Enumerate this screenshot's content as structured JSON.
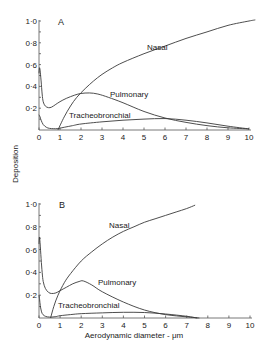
{
  "chart_data": [
    {
      "type": "line",
      "panel": "A",
      "title": "A",
      "xlabel": "Aerodynamic diameter - μm",
      "ylabel": "Deposition",
      "xlim": [
        0,
        10
      ],
      "ylim": [
        0,
        1.0
      ],
      "xticks": [
        "0",
        "1",
        "2",
        "3",
        "4",
        "5",
        "6",
        "7",
        "8",
        "9",
        "10"
      ],
      "yticks": [
        "0·2",
        "0·4",
        "0·6",
        "0·8",
        "1·0"
      ],
      "grid": false,
      "series": [
        {
          "name": "Nasal",
          "x": [
            0.9,
            1.2,
            1.5,
            1.8,
            2.2,
            2.6,
            3.0,
            3.5,
            4.0,
            5.0,
            6.0,
            7.0,
            8.0,
            9.0,
            10.0,
            10.3
          ],
          "y": [
            0.0,
            0.12,
            0.22,
            0.3,
            0.38,
            0.45,
            0.51,
            0.57,
            0.62,
            0.7,
            0.77,
            0.84,
            0.9,
            0.96,
            1.0,
            1.01
          ]
        },
        {
          "name": "Pulmonary",
          "x": [
            0.0,
            0.02,
            0.05,
            0.1,
            0.15,
            0.2,
            0.3,
            0.45,
            0.6,
            0.8,
            1.0,
            1.3,
            1.7,
            2.0,
            2.4,
            2.8,
            3.3,
            4.0,
            5.0,
            6.0,
            7.0,
            8.0,
            9.0,
            10.0
          ],
          "y": [
            0.52,
            0.57,
            0.55,
            0.45,
            0.33,
            0.26,
            0.22,
            0.205,
            0.21,
            0.235,
            0.26,
            0.29,
            0.32,
            0.335,
            0.34,
            0.33,
            0.3,
            0.25,
            0.17,
            0.11,
            0.07,
            0.04,
            0.02,
            0.01
          ]
        },
        {
          "name": "Tracheobronchial",
          "x": [
            0.0,
            0.05,
            0.1,
            0.2,
            0.35,
            0.5,
            0.7,
            0.9,
            1.2,
            1.6,
            2.0,
            3.0,
            4.0,
            5.0,
            6.0,
            7.0,
            8.0,
            9.0,
            10.0
          ],
          "y": [
            0.14,
            0.12,
            0.09,
            0.05,
            0.025,
            0.015,
            0.012,
            0.013,
            0.025,
            0.04,
            0.055,
            0.075,
            0.09,
            0.1,
            0.105,
            0.09,
            0.065,
            0.035,
            0.01
          ]
        }
      ]
    },
    {
      "type": "line",
      "panel": "B",
      "title": "B",
      "xlabel": "Aerodynamic diameter - μm",
      "ylabel": "Deposition",
      "xlim": [
        0,
        10
      ],
      "ylim": [
        0,
        1.0
      ],
      "xticks": [
        "0",
        "1",
        "2",
        "3",
        "4",
        "5",
        "6",
        "7",
        "8",
        "9",
        "10"
      ],
      "yticks": [
        "0·2",
        "0·4",
        "0·6",
        "0·8",
        "1·0"
      ],
      "grid": false,
      "series": [
        {
          "name": "Nasal",
          "x": [
            0.55,
            0.7,
            0.9,
            1.2,
            1.5,
            2.0,
            2.5,
            3.0,
            3.5,
            4.0,
            4.5,
            5.0,
            5.5,
            6.0,
            6.5,
            7.0,
            7.4
          ],
          "y": [
            0.0,
            0.1,
            0.2,
            0.31,
            0.39,
            0.5,
            0.58,
            0.65,
            0.71,
            0.76,
            0.8,
            0.84,
            0.87,
            0.9,
            0.93,
            0.96,
            0.99
          ]
        },
        {
          "name": "Pulmonary",
          "x": [
            0.0,
            0.02,
            0.05,
            0.1,
            0.15,
            0.2,
            0.3,
            0.45,
            0.6,
            0.8,
            1.0,
            1.3,
            1.6,
            1.9,
            2.1,
            2.5,
            3.0,
            4.0,
            5.0,
            6.0,
            7.0,
            7.6
          ],
          "y": [
            0.65,
            0.71,
            0.66,
            0.52,
            0.4,
            0.32,
            0.26,
            0.225,
            0.215,
            0.22,
            0.24,
            0.27,
            0.3,
            0.32,
            0.325,
            0.29,
            0.23,
            0.14,
            0.07,
            0.03,
            0.01,
            0.0
          ]
        },
        {
          "name": "Tracheobronchial",
          "x": [
            0.0,
            0.03,
            0.06,
            0.1,
            0.15,
            0.25,
            0.4,
            0.6,
            0.8,
            1.0,
            1.5,
            2.0,
            3.0,
            4.0,
            5.0,
            6.0,
            7.0,
            7.5
          ],
          "y": [
            0.2,
            0.16,
            0.11,
            0.07,
            0.04,
            0.02,
            0.01,
            0.008,
            0.012,
            0.02,
            0.03,
            0.038,
            0.045,
            0.05,
            0.048,
            0.035,
            0.015,
            0.0
          ]
        }
      ]
    }
  ],
  "labels": {
    "ylabel": "Deposition",
    "xlabel": "Aerodynamic diameter - μm",
    "panel_a": "A",
    "panel_b": "B",
    "nasal": "Nasal",
    "pulmonary": "Pulmonary",
    "tracheobronchial": "Tracheobronchial"
  }
}
